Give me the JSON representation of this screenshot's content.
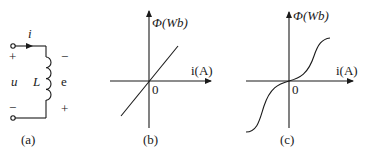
{
  "figure": {
    "panels": [
      {
        "id": "a",
        "caption": "(a)",
        "type": "circuit",
        "labels": {
          "current": "i",
          "voltage": "u",
          "inductor": "L",
          "emf": "e",
          "u_top_sign": "+",
          "u_bottom_sign": "−",
          "e_top_sign": "−",
          "e_bottom_sign": "+"
        }
      },
      {
        "id": "b",
        "caption": "(b)",
        "type": "graph",
        "y_label": "Φ(Wb)",
        "x_label": "i(A)",
        "origin_label": "0",
        "curve": "linear"
      },
      {
        "id": "c",
        "caption": "(c)",
        "type": "graph",
        "y_label": "Φ(Wb)",
        "x_label": "i(A)",
        "origin_label": "0",
        "curve": "s-shaped saturation"
      }
    ],
    "colors": {
      "ink": "#1a1a1a",
      "background": "#ffffff"
    }
  }
}
